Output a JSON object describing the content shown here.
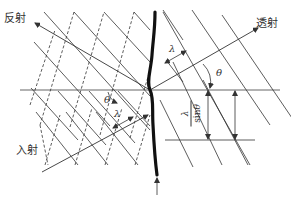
{
  "diagram": {
    "type": "wave refraction at interface",
    "labels": {
      "reflected": "反射",
      "transmitted": "透射",
      "incident": "入射"
    },
    "symbols": {
      "wavelength": "λ",
      "angle": "θ",
      "spacing_num": "λ",
      "spacing_den_prefix": "sin",
      "spacing_den_var": "θ"
    },
    "colors": {
      "line": "#333333",
      "interface": "#111111",
      "background": "#ffffff"
    }
  }
}
